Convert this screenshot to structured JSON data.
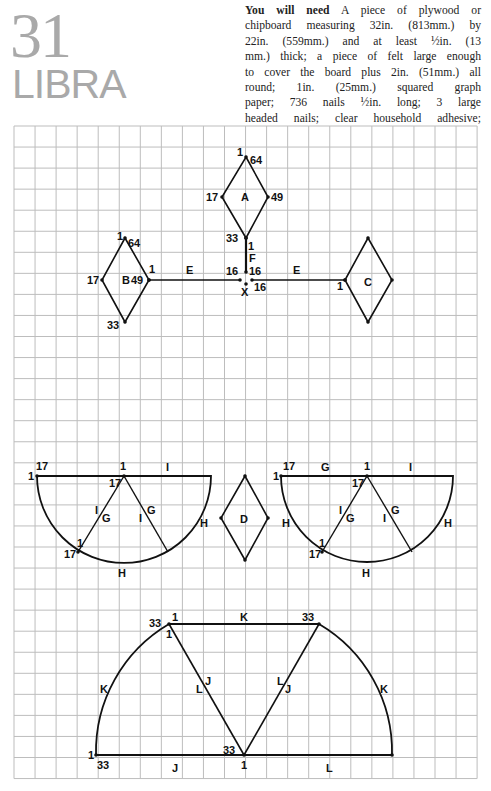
{
  "header": {
    "project_number": "31",
    "project_name": "LIBRA",
    "needs_heading": "You will need",
    "needs_lines": [
      " A piece of plywood or",
      "chipboard measuring 32in. (813mm.) by",
      "22in. (559mm.) and at least ½in. (13",
      "mm.) thick; a piece of felt large enough",
      "to cover the board plus 2in. (51mm.) all",
      "round; 1in. (25mm.) squared graph",
      "paper; 736 nails ½in. long; 3 large",
      "headed nails; clear household adhesive;"
    ]
  },
  "grid": {
    "left": 14,
    "top": 126,
    "columns": 22,
    "rows": 31,
    "cell": 21.05,
    "line_color": "#bdbdbd",
    "stroke_color": "#111111"
  },
  "diagram": {
    "diamonds": [
      {
        "id": "A",
        "top": [
          246,
          157
        ],
        "left": [
          222,
          197
        ],
        "right": [
          268,
          197
        ],
        "bottom": [
          246,
          238
        ],
        "labels": [
          {
            "text": "1",
            "x": 237,
            "y": 156
          },
          {
            "text": "64",
            "x": 250,
            "y": 164
          },
          {
            "text": "17",
            "x": 206,
            "y": 201
          },
          {
            "text": "A",
            "x": 241,
            "y": 201
          },
          {
            "text": "49",
            "x": 271,
            "y": 201
          },
          {
            "text": "33",
            "x": 226,
            "y": 242
          },
          {
            "text": "1",
            "x": 248,
            "y": 250
          }
        ]
      },
      {
        "id": "B",
        "top": [
          125,
          238
        ],
        "left": [
          102,
          280
        ],
        "right": [
          149,
          280
        ],
        "bottom": [
          125,
          322
        ],
        "labels": [
          {
            "text": "1",
            "x": 117,
            "y": 240
          },
          {
            "text": "64",
            "x": 128,
            "y": 247
          },
          {
            "text": "17",
            "x": 87,
            "y": 284
          },
          {
            "text": "B",
            "x": 122,
            "y": 284
          },
          {
            "text": "49",
            "x": 131,
            "y": 284
          },
          {
            "text": "33",
            "x": 107,
            "y": 329
          },
          {
            "text": "1",
            "x": 149,
            "y": 273
          }
        ]
      },
      {
        "id": "C",
        "top": [
          368,
          238
        ],
        "left": [
          345,
          280
        ],
        "right": [
          392,
          280
        ],
        "bottom": [
          368,
          322
        ],
        "labels": [
          {
            "text": "C",
            "x": 364,
            "y": 286
          },
          {
            "text": "1",
            "x": 337,
            "y": 290
          }
        ]
      },
      {
        "id": "D",
        "top": [
          245,
          476
        ],
        "left": [
          221,
          518
        ],
        "right": [
          268,
          518
        ],
        "bottom": [
          245,
          560
        ],
        "labels": [
          {
            "text": "D",
            "x": 240,
            "y": 523
          }
        ]
      }
    ],
    "lines": [
      {
        "id": "E-left",
        "from": [
          149,
          280
        ],
        "to": [
          240,
          280
        ],
        "label": {
          "text": "E",
          "x": 186,
          "y": 274
        }
      },
      {
        "id": "E-right",
        "from": [
          252,
          280
        ],
        "to": [
          345,
          280
        ],
        "label": {
          "text": "E",
          "x": 293,
          "y": 274
        }
      },
      {
        "id": "F",
        "from": [
          246,
          238
        ],
        "to": [
          246,
          272
        ],
        "label": {
          "text": "F",
          "x": 249,
          "y": 262
        }
      }
    ],
    "extra_labels": [
      {
        "text": "16",
        "x": 226,
        "y": 275
      },
      {
        "text": "16",
        "x": 249,
        "y": 275
      },
      {
        "text": "16",
        "x": 254,
        "y": 291
      },
      {
        "text": "X",
        "x": 241,
        "y": 296
      }
    ],
    "semicircles": [
      {
        "id": "left-half",
        "cx": 124,
        "cy": 476,
        "r": 87,
        "chords": [
          [
            124,
            476,
            78,
            552
          ],
          [
            124,
            476,
            168,
            552
          ]
        ],
        "labels": [
          {
            "text": "17",
            "x": 36,
            "y": 470
          },
          {
            "text": "1",
            "x": 28,
            "y": 480
          },
          {
            "text": "1",
            "x": 120,
            "y": 470
          },
          {
            "text": "I",
            "x": 166,
            "y": 471
          },
          {
            "text": "17",
            "x": 109,
            "y": 487
          },
          {
            "text": "I",
            "x": 95,
            "y": 514
          },
          {
            "text": "G",
            "x": 102,
            "y": 522
          },
          {
            "text": "I",
            "x": 139,
            "y": 522
          },
          {
            "text": "G",
            "x": 147,
            "y": 514
          },
          {
            "text": "H",
            "x": 200,
            "y": 527
          },
          {
            "text": "1",
            "x": 77,
            "y": 547
          },
          {
            "text": "17",
            "x": 64,
            "y": 558
          },
          {
            "text": "H",
            "x": 118,
            "y": 577
          }
        ]
      },
      {
        "id": "right-half",
        "cx": 367,
        "cy": 476,
        "r": 86,
        "chords": [
          [
            367,
            476,
            322,
            552
          ],
          [
            367,
            476,
            412,
            552
          ]
        ],
        "labels": [
          {
            "text": "17",
            "x": 283,
            "y": 470
          },
          {
            "text": "1",
            "x": 273,
            "y": 480
          },
          {
            "text": "G",
            "x": 321,
            "y": 471
          },
          {
            "text": "1",
            "x": 364,
            "y": 470
          },
          {
            "text": "I",
            "x": 409,
            "y": 471
          },
          {
            "text": "17",
            "x": 352,
            "y": 487
          },
          {
            "text": "I",
            "x": 339,
            "y": 514
          },
          {
            "text": "G",
            "x": 346,
            "y": 522
          },
          {
            "text": "I",
            "x": 383,
            "y": 522
          },
          {
            "text": "G",
            "x": 391,
            "y": 514
          },
          {
            "text": "H",
            "x": 282,
            "y": 527
          },
          {
            "text": "H",
            "x": 444,
            "y": 527
          },
          {
            "text": "1",
            "x": 319,
            "y": 547
          },
          {
            "text": "17",
            "x": 309,
            "y": 558
          },
          {
            "text": "H",
            "x": 362,
            "y": 577
          }
        ]
      }
    ],
    "bottom_shape": {
      "apex": [
        244,
        755
      ],
      "left_end": [
        96,
        755
      ],
      "right_end": [
        392,
        755
      ],
      "top_left": [
        169,
        624
      ],
      "top_right": [
        319,
        624
      ],
      "r": 148,
      "labels": [
        {
          "text": "33",
          "x": 149,
          "y": 627
        },
        {
          "text": "1",
          "x": 172,
          "y": 621
        },
        {
          "text": "1",
          "x": 166,
          "y": 638
        },
        {
          "text": "K",
          "x": 240,
          "y": 621
        },
        {
          "text": "33",
          "x": 302,
          "y": 621
        },
        {
          "text": "K",
          "x": 100,
          "y": 693
        },
        {
          "text": "L",
          "x": 196,
          "y": 693
        },
        {
          "text": "J",
          "x": 205,
          "y": 685
        },
        {
          "text": "L",
          "x": 277,
          "y": 685
        },
        {
          "text": "J",
          "x": 285,
          "y": 693
        },
        {
          "text": "K",
          "x": 380,
          "y": 693
        },
        {
          "text": "1",
          "x": 88,
          "y": 759
        },
        {
          "text": "33",
          "x": 97,
          "y": 769
        },
        {
          "text": "J",
          "x": 172,
          "y": 772
        },
        {
          "text": "33",
          "x": 223,
          "y": 754
        },
        {
          "text": "1",
          "x": 241,
          "y": 769
        },
        {
          "text": "L",
          "x": 326,
          "y": 772
        }
      ]
    }
  }
}
